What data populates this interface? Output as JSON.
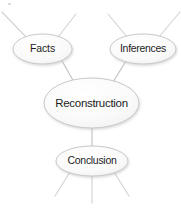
{
  "diagram": {
    "type": "cluster-map",
    "canvas": {
      "width": 181,
      "height": 209,
      "background": "#ffffff"
    },
    "style": {
      "node_fill": "#f7f7f7",
      "node_fill_highlight": "#fefefe",
      "node_stroke": "#c9c9c9",
      "node_shadow": "#d8d8d8",
      "edge_stroke": "#c4c4c4",
      "stub_stroke": "#d2d2d2",
      "label_color": "#1c1c1c"
    },
    "nodes": [
      {
        "id": "facts",
        "label": "Facts",
        "cx": 42.5,
        "cy": 49,
        "rx": 29.5,
        "ry": 15,
        "font_size": 10.5,
        "letter_spacing": -0.1
      },
      {
        "id": "inferences",
        "label": "Inferences",
        "cx": 143,
        "cy": 49,
        "rx": 33,
        "ry": 15,
        "font_size": 10.5,
        "letter_spacing": -0.3
      },
      {
        "id": "reconstruction",
        "label": "Reconstruction",
        "cx": 91.5,
        "cy": 103,
        "rx": 47.5,
        "ry": 25,
        "font_size": 11.5,
        "letter_spacing": -0.3
      },
      {
        "id": "conclusion",
        "label": "Conclusion",
        "cx": 92,
        "cy": 161,
        "rx": 36,
        "ry": 15,
        "font_size": 10.5,
        "letter_spacing": -0.3
      }
    ],
    "edges": [
      {
        "id": "facts-to-reconstruction",
        "from": "facts",
        "to": "reconstruction",
        "x1": 62,
        "y1": 61,
        "x2": 74,
        "y2": 82
      },
      {
        "id": "inferences-to-reconstruction",
        "from": "inferences",
        "to": "reconstruction",
        "x1": 126,
        "y1": 61,
        "x2": 113,
        "y2": 82
      },
      {
        "id": "reconstruction-to-conclusion",
        "from": "reconstruction",
        "to": "conclusion",
        "x1": 92,
        "y1": 128,
        "x2": 92,
        "y2": 146
      }
    ],
    "stubs": [
      {
        "id": "facts-stub-upper-left",
        "from": "facts",
        "x1": 26,
        "y1": 37,
        "x2": 2,
        "y2": 12
      },
      {
        "id": "facts-stub-upper-right",
        "from": "facts",
        "x1": 58,
        "y1": 37,
        "x2": 76,
        "y2": 14
      },
      {
        "id": "inferences-stub-upper-left",
        "from": "inferences",
        "x1": 127,
        "y1": 37,
        "x2": 108,
        "y2": 14
      },
      {
        "id": "inferences-stub-upper-right",
        "from": "inferences",
        "x1": 159,
        "y1": 37,
        "x2": 180,
        "y2": 12
      },
      {
        "id": "conclusion-stub-lower-left",
        "from": "conclusion",
        "x1": 70,
        "y1": 172,
        "x2": 55,
        "y2": 196
      },
      {
        "id": "conclusion-stub-lower-center",
        "from": "conclusion",
        "x1": 92,
        "y1": 176,
        "x2": 92,
        "y2": 203
      },
      {
        "id": "conclusion-stub-lower-right",
        "from": "conclusion",
        "x1": 114,
        "y1": 172,
        "x2": 129,
        "y2": 196
      }
    ],
    "artifact": {
      "id": "corner-speck",
      "x": 8,
      "y": 3,
      "width": 3,
      "height": 2,
      "color": "#dedede"
    }
  }
}
